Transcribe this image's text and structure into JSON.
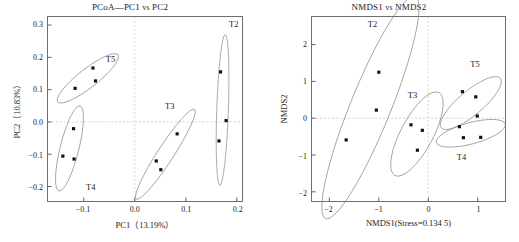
{
  "figure": {
    "panels": [
      "pcoa",
      "nmds"
    ]
  },
  "chart_data": [
    {
      "id": "pcoa",
      "type": "scatter",
      "title": "PCoA—PC1 vs PC2",
      "title_main": "PCoA—PC1",
      "title_vs": "vs",
      "title_tail": "PC2",
      "xlabel": "PC1（13.19%）",
      "ylabel": "PC2（10.83%）",
      "xlim": [
        -0.17,
        0.21
      ],
      "ylim": [
        -0.245,
        0.325
      ],
      "xticks": [
        -0.1,
        0.0,
        0.1,
        0.2
      ],
      "xticklabels": [
        "−0.1",
        "0.0",
        "0.1",
        "0.2"
      ],
      "yticks": [
        -0.2,
        -0.1,
        0.0,
        0.1,
        0.2,
        0.3
      ],
      "yticklabels": [
        "−0.2",
        "−0.1",
        "0.0",
        "0.1",
        "0.2",
        "0.3"
      ],
      "grid": true,
      "grid_lines": {
        "x": [
          0.0
        ],
        "y": [
          0.0
        ]
      },
      "legend": "none",
      "groups": [
        {
          "name": "T5",
          "label_x": -0.047,
          "label_y": 0.193,
          "points": [
            [
              -0.082,
              0.167
            ],
            [
              -0.077,
              0.127
            ],
            [
              -0.117,
              0.104
            ]
          ],
          "ellipse": {
            "cx": -0.092,
            "cy": 0.135,
            "rx": 0.075,
            "ry": 0.029,
            "angle": -38
          }
        },
        {
          "name": "T4",
          "label_x": -0.085,
          "label_y": -0.199,
          "points": [
            [
              -0.12,
              -0.021
            ],
            [
              -0.141,
              -0.106
            ],
            [
              -0.119,
              -0.115
            ]
          ],
          "ellipse": {
            "cx": -0.128,
            "cy": -0.082,
            "rx": 0.086,
            "ry": 0.029,
            "angle": -76
          }
        },
        {
          "name": "T3",
          "label_x": 0.068,
          "label_y": 0.049,
          "points": [
            [
              0.083,
              -0.037
            ],
            [
              0.042,
              -0.121
            ],
            [
              0.051,
              -0.148
            ]
          ],
          "ellipse": {
            "cx": 0.06,
            "cy": -0.1,
            "rx": 0.105,
            "ry": 0.025,
            "angle": -57
          }
        },
        {
          "name": "T2",
          "label_x": 0.192,
          "label_y": 0.299,
          "points": [
            [
              0.168,
              0.155
            ],
            [
              0.179,
              0.004
            ],
            [
              0.165,
              -0.059
            ]
          ],
          "ellipse": {
            "cx": 0.172,
            "cy": 0.037,
            "rx": 0.148,
            "ry": 0.018,
            "angle": -88
          }
        }
      ]
    },
    {
      "id": "nmds",
      "type": "scatter",
      "title": "NMDS1 vs NMDS2",
      "title_main": "NMDS1",
      "title_vs": "vs",
      "title_tail": "NMDS2",
      "xlabel": "NMDS1(Stress=0.134 5)",
      "ylabel": "NMDS2",
      "xlim": [
        -2.35,
        1.55
      ],
      "ylim": [
        -2.25,
        2.75
      ],
      "xticks": [
        -2,
        -1,
        0,
        1
      ],
      "xticklabels": [
        "−2",
        "−1",
        "0",
        "1"
      ],
      "yticks": [
        -2,
        -1,
        0,
        1,
        2
      ],
      "yticklabels": [
        "−2",
        "−1",
        "0",
        "1",
        "2"
      ],
      "grid": true,
      "grid_lines": {
        "x": [
          0
        ],
        "y": [
          0
        ]
      },
      "legend": "none",
      "groups": [
        {
          "name": "T2",
          "label_x": -1.12,
          "label_y": 2.53,
          "points": [
            [
              -1.0,
              1.25
            ],
            [
              -1.05,
              0.22
            ],
            [
              -1.66,
              -0.59
            ]
          ],
          "ellipse": {
            "cx": -1.17,
            "cy": 0.29,
            "rx": 2.42,
            "ry": 0.55,
            "angle": -68
          }
        },
        {
          "name": "T3",
          "label_x": -0.32,
          "label_y": 0.62,
          "points": [
            [
              -0.35,
              -0.18
            ],
            [
              -0.12,
              -0.33
            ],
            [
              -0.22,
              -0.87
            ]
          ],
          "ellipse": {
            "cx": -0.23,
            "cy": -0.43,
            "rx": 0.95,
            "ry": 0.44,
            "angle": -62
          }
        },
        {
          "name": "T5",
          "label_x": 0.93,
          "label_y": 1.45,
          "points": [
            [
              0.69,
              0.72
            ],
            [
              0.96,
              0.58
            ],
            [
              0.99,
              0.06
            ]
          ],
          "ellipse": {
            "cx": 0.86,
            "cy": 0.41,
            "rx": 0.78,
            "ry": 0.33,
            "angle": -40
          }
        },
        {
          "name": "T4",
          "label_x": 0.66,
          "label_y": -1.05,
          "points": [
            [
              0.63,
              -0.23
            ],
            [
              0.71,
              -0.53
            ],
            [
              1.06,
              -0.52
            ]
          ],
          "ellipse": {
            "cx": 0.86,
            "cy": -0.41,
            "rx": 0.72,
            "ry": 0.29,
            "angle": -15
          }
        }
      ]
    }
  ]
}
